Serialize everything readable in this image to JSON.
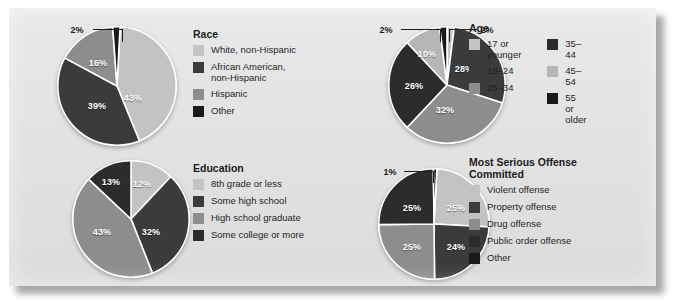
{
  "palette": {
    "light": "#c3c3c3",
    "medium": "#8d8d8d",
    "dark": "#3b3b3b",
    "darker": "#2c2c2c",
    "black": "#191919",
    "panel_bg": "#e2e2e2",
    "slice_divider": "#ffffff"
  },
  "chart_data": [
    {
      "type": "pie",
      "title": "Race",
      "id": "race",
      "categories": [
        "White, non-Hispanic",
        "African American,\nnon-Hispanic",
        "Hispanic",
        "Other"
      ],
      "values": [
        43,
        39,
        16,
        2
      ],
      "value_labels": [
        "43%",
        "39%",
        "16%",
        "2%"
      ],
      "colors": [
        "#c3c3c3",
        "#3b3b3b",
        "#8d8d8d",
        "#191919"
      ],
      "legend_position": "right",
      "legend_columns": 1,
      "callouts": [
        {
          "label": "2%",
          "slice": "Other"
        }
      ]
    },
    {
      "type": "pie",
      "title": "Age",
      "id": "age",
      "categories": [
        "17 or younger",
        "18–24",
        "25–34",
        "35–44",
        "45–54",
        "55 or older"
      ],
      "values": [
        2,
        28,
        32,
        26,
        10,
        2
      ],
      "value_labels": [
        "2%",
        "28%",
        "32%",
        "26%",
        "10%",
        "2%"
      ],
      "colors": [
        "#c3c3c3",
        "#3b3b3b",
        "#8d8d8d",
        "#2c2c2c",
        "#b6b6b6",
        "#191919"
      ],
      "legend_position": "right",
      "legend_columns": 2,
      "legend_col1": [
        "17 or younger",
        "18–24",
        "25–34"
      ],
      "legend_col2": [
        "35–44",
        "45–54",
        "55 or older"
      ],
      "legend_col1_colors": [
        "#c3c3c3",
        "#3b3b3b",
        "#8d8d8d"
      ],
      "legend_col2_colors": [
        "#2c2c2c",
        "#b6b6b6",
        "#191919"
      ],
      "callouts": [
        {
          "label": "2%",
          "slice": "55 or older"
        },
        {
          "label": "2%",
          "slice": "17 or younger"
        }
      ]
    },
    {
      "type": "pie",
      "title": "Education",
      "id": "education",
      "categories": [
        "8th grade or less",
        "Some high school",
        "High school graduate",
        "Some college or more"
      ],
      "values": [
        12,
        32,
        43,
        13
      ],
      "value_labels": [
        "12%",
        "32%",
        "43%",
        "13%"
      ],
      "colors": [
        "#c3c3c3",
        "#3b3b3b",
        "#8d8d8d",
        "#2c2c2c"
      ],
      "legend_position": "right",
      "legend_columns": 1,
      "callouts": []
    },
    {
      "type": "pie",
      "title": "Most Serious Offense\nCommitted",
      "id": "offense",
      "categories": [
        "Violent offense",
        "Property offense",
        "Drug offense",
        "Public order offense",
        "Other"
      ],
      "values": [
        25,
        24,
        25,
        25,
        1
      ],
      "value_labels": [
        "25%",
        "24%",
        "25%",
        "25%",
        "1%"
      ],
      "colors": [
        "#c3c3c3",
        "#3b3b3b",
        "#8d8d8d",
        "#2c2c2c",
        "#191919"
      ],
      "legend_position": "right",
      "legend_columns": 1,
      "callouts": [
        {
          "label": "1%",
          "slice": "Other"
        }
      ]
    }
  ],
  "race": {
    "title": "Race",
    "labels": {
      "s1": "43%",
      "s2": "39%",
      "s3": "16%",
      "s4": "2%"
    },
    "legend": [
      {
        "label": "White, non-Hispanic",
        "color": "#c3c3c3"
      },
      {
        "label": "African American,\nnon-Hispanic",
        "color": "#3b3b3b"
      },
      {
        "label": "Hispanic",
        "color": "#8d8d8d"
      },
      {
        "label": "Other",
        "color": "#191919"
      }
    ]
  },
  "age": {
    "title": "Age",
    "labels": {
      "s1": "2%",
      "s2": "28%",
      "s3": "32%",
      "s4": "26%",
      "s5": "10%",
      "s6": "2%"
    },
    "legend_col1": [
      {
        "label": "17 or younger",
        "color": "#c3c3c3"
      },
      {
        "label": "18–24",
        "color": "#3b3b3b"
      },
      {
        "label": "25–34",
        "color": "#8d8d8d"
      }
    ],
    "legend_col2": [
      {
        "label": "35–44",
        "color": "#2c2c2c"
      },
      {
        "label": "45–54",
        "color": "#b6b6b6"
      },
      {
        "label": "55 or older",
        "color": "#191919"
      }
    ]
  },
  "education": {
    "title": "Education",
    "labels": {
      "s1": "12%",
      "s2": "32%",
      "s3": "43%",
      "s4": "13%"
    },
    "legend": [
      {
        "label": "8th grade or less",
        "color": "#c3c3c3"
      },
      {
        "label": "Some high school",
        "color": "#3b3b3b"
      },
      {
        "label": "High school graduate",
        "color": "#8d8d8d"
      },
      {
        "label": "Some college or more",
        "color": "#2c2c2c"
      }
    ]
  },
  "offense": {
    "title": "Most Serious Offense\nCommitted",
    "labels": {
      "s1": "25%",
      "s2": "24%",
      "s3": "25%",
      "s4": "25%",
      "s5": "1%"
    },
    "legend": [
      {
        "label": "Violent offense",
        "color": "#c3c3c3"
      },
      {
        "label": "Property offense",
        "color": "#3b3b3b"
      },
      {
        "label": "Drug offense",
        "color": "#8d8d8d"
      },
      {
        "label": "Public order offense",
        "color": "#2c2c2c"
      },
      {
        "label": "Other",
        "color": "#191919"
      }
    ]
  }
}
